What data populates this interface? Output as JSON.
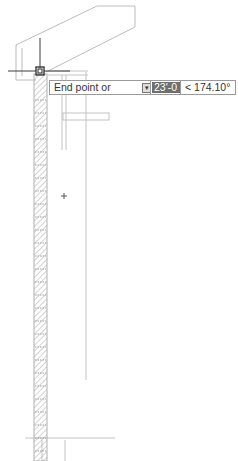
{
  "drawing": {
    "type": "architectural-section",
    "wall_hatch": "brick/ANSI31-diagonal",
    "line_color": "#b8b8b8",
    "hatch_color": "#9c9c9c",
    "cursor_color": "#3c3c3c"
  },
  "dynamic_input": {
    "prompt_label": "End point or",
    "options_icon": "down-arrow-icon",
    "distance_value": "23'-0 1/16\"",
    "angle_value": "< 174.10°",
    "selected_field_bg": "#6f6f6f"
  },
  "cursor": {
    "type": "crosshair-with-pickbox",
    "x": 40,
    "y": 72
  },
  "secondary_cursor": {
    "type": "small-cross",
    "x": 64,
    "y": 196
  }
}
